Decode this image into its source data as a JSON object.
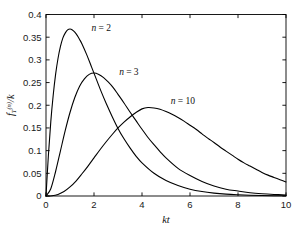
{
  "chart_data": {
    "type": "line",
    "title": "",
    "xlabel": "kt",
    "ylabel": "f_T^(n)/k",
    "ylabel_parts": {
      "base": "f",
      "sub": "T",
      "sup": "(n)",
      "tail": "/k"
    },
    "xlim": [
      0,
      10
    ],
    "ylim": [
      0,
      0.4
    ],
    "xticks": [
      0,
      2,
      4,
      6,
      8,
      10
    ],
    "xticklabels": [
      "0",
      "2",
      "4",
      "6",
      "8",
      "10"
    ],
    "yticks": [
      0,
      0.05,
      0.1,
      0.15,
      0.2,
      0.25,
      0.3,
      0.35,
      0.4
    ],
    "yticklabels": [
      "0",
      "0.05",
      "0.1",
      "0.15",
      "0.2",
      "0.25",
      "0.3",
      "0.35",
      "0.4"
    ],
    "grid": false,
    "legend_position": "inline-annotations",
    "line_color": "#000000",
    "line_width": 1.1,
    "series": [
      {
        "name": "n = 2",
        "n": 2,
        "peak_x": 1.0,
        "peak_y": 0.368,
        "annotation": {
          "text": "n = 2",
          "x": 1.9,
          "y": 0.363
        },
        "points": [
          [
            0.0,
            0.0
          ],
          [
            0.1,
            0.09
          ],
          [
            0.2,
            0.164
          ],
          [
            0.3,
            0.222
          ],
          [
            0.4,
            0.268
          ],
          [
            0.5,
            0.303
          ],
          [
            0.6,
            0.329
          ],
          [
            0.7,
            0.348
          ],
          [
            0.8,
            0.359
          ],
          [
            0.9,
            0.366
          ],
          [
            1.0,
            0.368
          ],
          [
            1.1,
            0.366
          ],
          [
            1.2,
            0.361
          ],
          [
            1.3,
            0.354
          ],
          [
            1.4,
            0.345
          ],
          [
            1.5,
            0.335
          ],
          [
            1.7,
            0.311
          ],
          [
            1.9,
            0.284
          ],
          [
            2.1,
            0.257
          ],
          [
            2.3,
            0.23
          ],
          [
            2.5,
            0.205
          ],
          [
            2.75,
            0.176
          ],
          [
            3.0,
            0.149
          ],
          [
            3.25,
            0.126
          ],
          [
            3.5,
            0.106
          ],
          [
            3.75,
            0.088
          ],
          [
            4.0,
            0.073
          ],
          [
            4.5,
            0.05
          ],
          [
            5.0,
            0.034
          ],
          [
            5.5,
            0.023
          ],
          [
            6.0,
            0.015
          ],
          [
            6.5,
            0.0098
          ],
          [
            7.0,
            0.0064
          ],
          [
            7.5,
            0.0041
          ],
          [
            8.0,
            0.0027
          ],
          [
            8.5,
            0.0017
          ],
          [
            9.0,
            0.0011
          ],
          [
            9.5,
            0.0007
          ],
          [
            10.0,
            0.00045
          ]
        ]
      },
      {
        "name": "n = 3",
        "n": 3,
        "peak_x": 2.0,
        "peak_y": 0.271,
        "annotation": {
          "text": "n = 3",
          "x": 3.05,
          "y": 0.266
        },
        "points": [
          [
            0.0,
            0.0
          ],
          [
            0.2,
            0.016
          ],
          [
            0.4,
            0.054
          ],
          [
            0.6,
            0.099
          ],
          [
            0.8,
            0.144
          ],
          [
            1.0,
            0.184
          ],
          [
            1.2,
            0.217
          ],
          [
            1.4,
            0.242
          ],
          [
            1.6,
            0.258
          ],
          [
            1.8,
            0.268
          ],
          [
            2.0,
            0.271
          ],
          [
            2.2,
            0.268
          ],
          [
            2.4,
            0.261
          ],
          [
            2.6,
            0.251
          ],
          [
            2.8,
            0.239
          ],
          [
            3.0,
            0.224
          ],
          [
            3.25,
            0.205
          ],
          [
            3.5,
            0.185
          ],
          [
            3.75,
            0.166
          ],
          [
            4.0,
            0.147
          ],
          [
            4.25,
            0.129
          ],
          [
            4.5,
            0.113
          ],
          [
            4.75,
            0.098
          ],
          [
            5.0,
            0.084
          ],
          [
            5.5,
            0.061
          ],
          [
            6.0,
            0.045
          ],
          [
            6.5,
            0.032
          ],
          [
            7.0,
            0.022
          ],
          [
            7.5,
            0.015
          ],
          [
            8.0,
            0.011
          ],
          [
            8.5,
            0.0073
          ],
          [
            9.0,
            0.005
          ],
          [
            9.5,
            0.0034
          ],
          [
            10.0,
            0.0023
          ]
        ]
      },
      {
        "name": "n = 10",
        "n": 10,
        "peak_x": 4.1,
        "peak_y": 0.195,
        "annotation": {
          "text": "n = 10",
          "x": 5.2,
          "y": 0.203
        },
        "points": [
          [
            0.0,
            0.0
          ],
          [
            0.25,
            0.0005
          ],
          [
            0.5,
            0.0035
          ],
          [
            0.75,
            0.0098
          ],
          [
            1.0,
            0.02
          ],
          [
            1.25,
            0.033
          ],
          [
            1.5,
            0.049
          ],
          [
            1.75,
            0.066
          ],
          [
            2.0,
            0.084
          ],
          [
            2.25,
            0.102
          ],
          [
            2.5,
            0.119
          ],
          [
            2.75,
            0.135
          ],
          [
            3.0,
            0.15
          ],
          [
            3.25,
            0.163
          ],
          [
            3.5,
            0.174
          ],
          [
            3.75,
            0.184
          ],
          [
            4.0,
            0.192
          ],
          [
            4.25,
            0.195
          ],
          [
            4.5,
            0.194
          ],
          [
            4.75,
            0.191
          ],
          [
            5.0,
            0.186
          ],
          [
            5.25,
            0.18
          ],
          [
            5.5,
            0.173
          ],
          [
            5.75,
            0.165
          ],
          [
            6.0,
            0.156
          ],
          [
            6.25,
            0.147
          ],
          [
            6.5,
            0.137
          ],
          [
            6.75,
            0.127
          ],
          [
            7.0,
            0.118
          ],
          [
            7.25,
            0.108
          ],
          [
            7.5,
            0.099
          ],
          [
            7.75,
            0.09
          ],
          [
            8.0,
            0.081
          ],
          [
            8.25,
            0.073
          ],
          [
            8.5,
            0.066
          ],
          [
            8.75,
            0.059
          ],
          [
            9.0,
            0.052
          ],
          [
            9.25,
            0.046
          ],
          [
            9.5,
            0.041
          ],
          [
            9.75,
            0.036
          ],
          [
            10.0,
            0.031
          ]
        ]
      }
    ]
  }
}
